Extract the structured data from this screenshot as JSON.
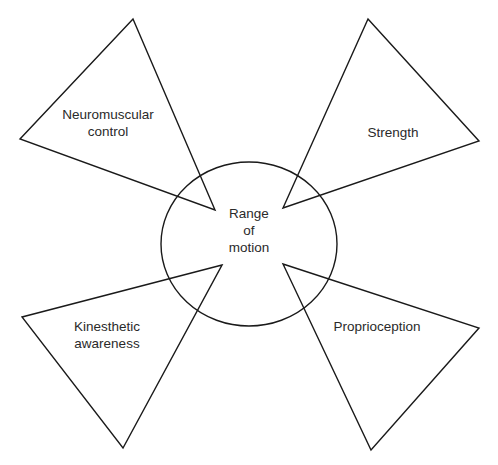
{
  "diagram": {
    "center": {
      "label_line1": "Range",
      "label_line2": "of",
      "label_line3": "motion"
    },
    "factors": [
      {
        "label_line1": "Neuromuscular",
        "label_line2": "control"
      },
      {
        "label_line1": "Strength"
      },
      {
        "label_line1": "Kinesthetic",
        "label_line2": "awareness"
      },
      {
        "label_line1": "Proprioception"
      }
    ],
    "colors": {
      "stroke": "#1a1a1a",
      "text": "#2a2a2a",
      "background": "#ffffff"
    }
  }
}
